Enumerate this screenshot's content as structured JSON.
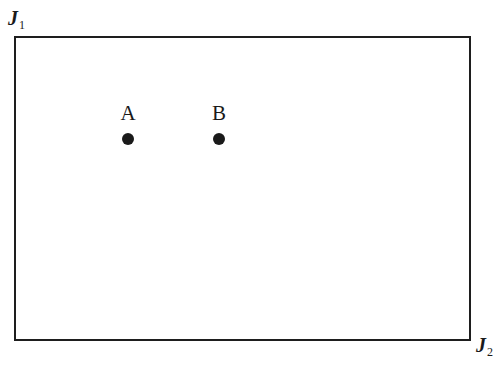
{
  "diagram": {
    "corners": {
      "top_left": {
        "letter": "J",
        "subscript": "1"
      },
      "bottom_right": {
        "letter": "J",
        "subscript": "2"
      }
    },
    "points": [
      {
        "label": "A",
        "x": 128,
        "y": 139
      },
      {
        "label": "B",
        "x": 219,
        "y": 139
      }
    ]
  }
}
